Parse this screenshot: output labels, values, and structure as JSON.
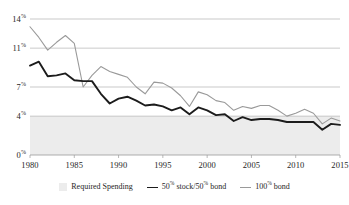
{
  "chart_data": {
    "type": "line",
    "title": "",
    "xlabel": "",
    "ylabel": "",
    "xlim": [
      1980,
      2015
    ],
    "ylim": [
      0,
      14
    ],
    "grid": true,
    "legend_position": "bottom-center",
    "y_ticks": [
      {
        "value": 14,
        "label": "14",
        "suffix": "%"
      },
      {
        "value": 11,
        "label": "11",
        "suffix": "%"
      },
      {
        "value": 7,
        "label": "7",
        "suffix": "%"
      },
      {
        "value": 4,
        "label": "4",
        "suffix": "%"
      },
      {
        "value": 0,
        "label": "0",
        "suffix": "%"
      }
    ],
    "x_ticks": [
      1980,
      1985,
      1990,
      1995,
      2000,
      2005,
      2010,
      2015
    ],
    "x": [
      1980,
      1981,
      1982,
      1983,
      1984,
      1985,
      1986,
      1987,
      1988,
      1989,
      1990,
      1991,
      1992,
      1993,
      1994,
      1995,
      1996,
      1997,
      1998,
      1999,
      2000,
      2001,
      2002,
      2003,
      2004,
      2005,
      2006,
      2007,
      2008,
      2009,
      2010,
      2011,
      2012,
      2013,
      2014,
      2015
    ],
    "bands": [
      {
        "name": "Required Spending",
        "label": "Required Spending",
        "color": "#ececec",
        "y_min": 0,
        "y_max": 4.0
      }
    ],
    "series": [
      {
        "name": "100-bond",
        "label": "100",
        "label_suffix": "%",
        "label_tail": " bond",
        "color": "#9a9a9a",
        "width": 1.1,
        "values": [
          13.2,
          12.1,
          10.8,
          11.6,
          12.3,
          11.5,
          7.0,
          8.2,
          9.1,
          8.6,
          8.3,
          8.0,
          7.0,
          6.3,
          7.5,
          7.4,
          6.9,
          6.1,
          5.0,
          6.5,
          6.2,
          5.6,
          5.4,
          4.6,
          5.0,
          4.8,
          5.1,
          5.1,
          4.6,
          4.0,
          4.3,
          4.7,
          4.3,
          3.2,
          3.8,
          3.5
        ]
      },
      {
        "name": "50-stock-50-bond",
        "label": "50",
        "label_suffix": "%",
        "label_mid": " stock/50",
        "label_tail": " bond",
        "color": "#1c1c1c",
        "width": 1.9,
        "values": [
          9.2,
          9.6,
          8.1,
          8.2,
          8.4,
          7.7,
          7.6,
          7.6,
          6.3,
          5.3,
          5.8,
          6.0,
          5.6,
          5.1,
          5.2,
          5.0,
          4.6,
          4.9,
          4.2,
          4.9,
          4.6,
          4.1,
          4.2,
          3.5,
          3.9,
          3.6,
          3.7,
          3.7,
          3.6,
          3.4,
          3.4,
          3.4,
          3.4,
          2.6,
          3.2,
          3.1
        ]
      }
    ]
  },
  "legend": {
    "items": [
      {
        "label": "Required Spending",
        "kind": "band"
      },
      {
        "label_main": "50",
        "pct": "%",
        "label_mid": " stock/50",
        "pct2": "%",
        "label_tail": " bond",
        "kind": "line-dark"
      },
      {
        "label_main": "100",
        "pct": "%",
        "label_tail": " bond",
        "kind": "line-gray"
      }
    ]
  }
}
